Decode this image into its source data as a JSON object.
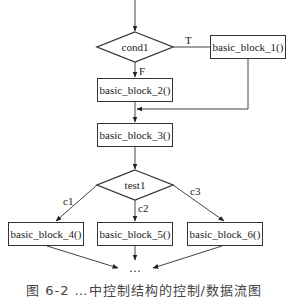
{
  "diagram": {
    "type": "flowchart",
    "nodes": {
      "cond1": {
        "label": "cond1",
        "shape": "diamond"
      },
      "test1": {
        "label": "test1",
        "shape": "diamond"
      },
      "bb1": {
        "label": "basic_block_1()",
        "shape": "rect"
      },
      "bb2": {
        "label": "basic_block_2()",
        "shape": "rect"
      },
      "bb3": {
        "label": "basic_block_3()",
        "shape": "rect"
      },
      "bb4": {
        "label": "basic_block_4()",
        "shape": "rect"
      },
      "bb5": {
        "label": "basic_block_5()",
        "shape": "rect"
      },
      "bb6": {
        "label": "basic_block_6()",
        "shape": "rect"
      },
      "ellipsis": {
        "label": "…"
      }
    },
    "edge_labels": {
      "true": "T",
      "false": "F",
      "c1": "c1",
      "c2": "c2",
      "c3": "c3"
    },
    "edges": [
      {
        "from": "entry",
        "to": "cond1"
      },
      {
        "from": "cond1",
        "to": "bb1",
        "label": "T"
      },
      {
        "from": "cond1",
        "to": "bb2",
        "label": "F"
      },
      {
        "from": "bb1",
        "to": "bb3"
      },
      {
        "from": "bb2",
        "to": "bb3"
      },
      {
        "from": "bb3",
        "to": "test1"
      },
      {
        "from": "test1",
        "to": "bb4",
        "label": "c1"
      },
      {
        "from": "test1",
        "to": "bb5",
        "label": "c2"
      },
      {
        "from": "test1",
        "to": "bb6",
        "label": "c3"
      },
      {
        "from": "bb4",
        "to": "ellipsis"
      },
      {
        "from": "bb5",
        "to": "ellipsis"
      },
      {
        "from": "bb6",
        "to": "ellipsis"
      }
    ],
    "caption": "图 6-2  …中控制结构的控制/数据流图",
    "colors": {
      "stroke": "#333333",
      "background": "#ffffff"
    }
  }
}
